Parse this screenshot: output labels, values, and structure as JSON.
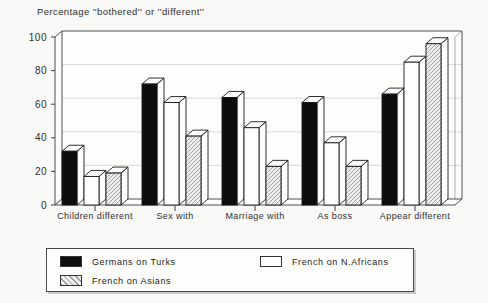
{
  "title": "Percentage ''bothered'' or ''different''",
  "chart_data": {
    "type": "bar",
    "style": "3d-grouped-bars",
    "categories": [
      "Children different",
      "Sex with",
      "Marriage with",
      "As boss",
      "Appear different"
    ],
    "series": [
      {
        "name": "Germans on Turks",
        "swatch": "black",
        "values": [
          32,
          72,
          64,
          61,
          66
        ]
      },
      {
        "name": "French on N.Africans",
        "swatch": "white",
        "values": [
          17,
          61,
          46,
          37,
          85
        ]
      },
      {
        "name": "French on Asians",
        "swatch": "hatch",
        "values": [
          19,
          41,
          23,
          23,
          96
        ]
      }
    ],
    "title": "Percentage ''bothered'' or ''different''",
    "xlabel": "",
    "ylabel": "",
    "ylim": [
      0,
      100
    ],
    "yticks": [
      0,
      20,
      40,
      60,
      80,
      100
    ],
    "grid": true,
    "legend_position": "bottom"
  },
  "colors": {
    "bar_black": "#0d0d0d",
    "bar_white": "#ffffff",
    "hatch_line": "#9a9a9a",
    "hatch_bg": "#ededed",
    "face_white": "#fefefe",
    "axis": "#3c3c3c",
    "edge": "#1a1a1a",
    "grid": "#d9d9d6",
    "wall": "#fdfdfb",
    "text": "#2f2f2f",
    "background": "#f9f9f7"
  }
}
